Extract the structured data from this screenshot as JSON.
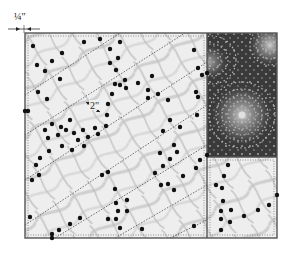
{
  "diagram": {
    "type": "quilt-layout-diagram",
    "seam_allowance_label": "¼\"",
    "spacing_label": "2\"",
    "colors": {
      "frame": "#555555",
      "light_fabric": "#ececec",
      "dark_fabric": "#3a3a3a",
      "dot": "#111111",
      "quilting_line": "#333333",
      "dark_fabric_dots": "#bdbdbd"
    },
    "panels": [
      {
        "name": "large-left-panel",
        "fabric": "light swirl print"
      },
      {
        "name": "top-right-panel",
        "fabric": "dark dotted circle print"
      },
      {
        "name": "bottom-right-panel",
        "fabric": "light swirl print"
      }
    ],
    "quilting": {
      "style": "diagonal parallel dotted lines",
      "spacing": "2\""
    }
  }
}
